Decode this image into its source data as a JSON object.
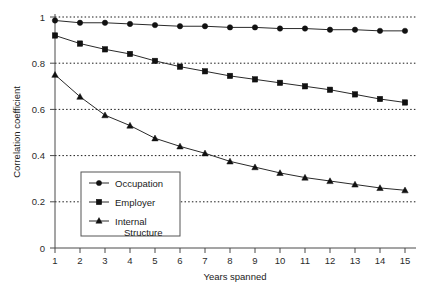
{
  "chart_data": {
    "type": "line",
    "title": "",
    "xlabel": "Years spanned",
    "ylabel": "Correlation coefficient",
    "x": [
      1,
      2,
      3,
      4,
      5,
      6,
      7,
      8,
      9,
      10,
      11,
      12,
      13,
      14,
      15
    ],
    "xlim": [
      1,
      15
    ],
    "ylim": [
      0,
      1
    ],
    "xticks": [
      "1",
      "2",
      "3",
      "4",
      "5",
      "6",
      "7",
      "8",
      "9",
      "10",
      "11",
      "12",
      "13",
      "14",
      "15"
    ],
    "yticks": [
      "0",
      "0.2",
      "0.4",
      "0.6",
      "0.8",
      "1"
    ],
    "ytick_values": [
      0,
      0.2,
      0.4,
      0.6,
      0.8,
      1
    ],
    "grid": "horizontal-dotted",
    "legend_position": "inside-lower-left",
    "series": [
      {
        "name": "Occupation",
        "marker": "circle",
        "values": [
          0.985,
          0.975,
          0.975,
          0.97,
          0.965,
          0.96,
          0.96,
          0.955,
          0.955,
          0.95,
          0.95,
          0.945,
          0.945,
          0.94,
          0.94
        ]
      },
      {
        "name": "Employer",
        "marker": "square",
        "values": [
          0.92,
          0.885,
          0.86,
          0.84,
          0.81,
          0.785,
          0.765,
          0.745,
          0.73,
          0.715,
          0.7,
          0.685,
          0.665,
          0.645,
          0.63
        ]
      },
      {
        "name": "Internal Structure",
        "marker": "triangle",
        "values": [
          0.75,
          0.655,
          0.575,
          0.53,
          0.475,
          0.44,
          0.41,
          0.375,
          0.35,
          0.325,
          0.305,
          0.29,
          0.275,
          0.26,
          0.25
        ]
      }
    ]
  },
  "axes": {
    "y_title": "Correlation coefficient",
    "x_title": "Years spanned"
  },
  "legend": {
    "entries": [
      {
        "label": "Occupation",
        "marker": "circle"
      },
      {
        "label": "Employer",
        "marker": "square"
      },
      {
        "label_line1": "Internal",
        "label_line2": "Structure",
        "marker": "triangle"
      }
    ]
  },
  "colors": {
    "line": "#2a2a2a",
    "marker": "#111111",
    "axis": "#4a4a4a",
    "grid": "#1a1a1a",
    "background": "#ffffff"
  }
}
